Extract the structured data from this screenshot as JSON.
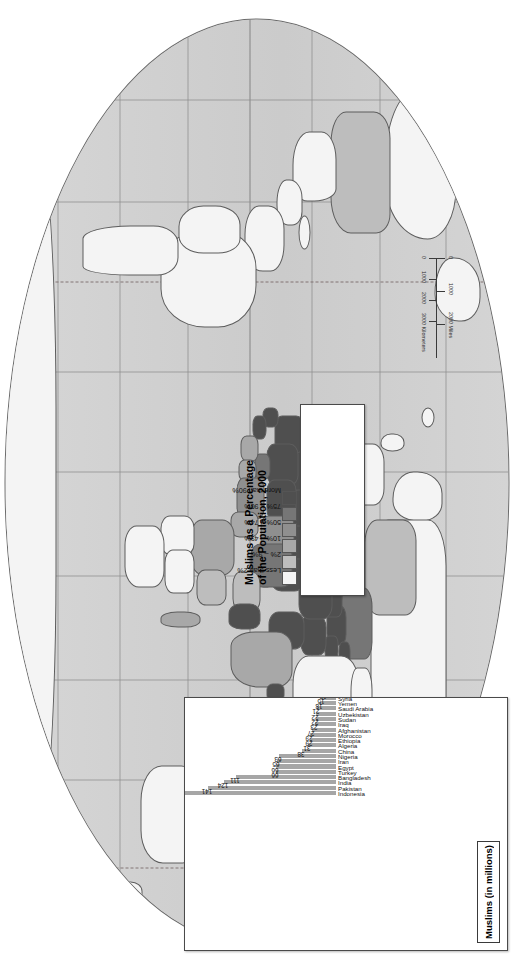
{
  "map": {
    "projection_label": "world-robinson",
    "background_color": "#ffffff",
    "ocean_color": "#cfcfcf",
    "graticule_color": "#8d8d8d",
    "border_color": "#5d5d5d"
  },
  "scalebar": {
    "miles_ticks": [
      "0",
      "1000",
      "2000"
    ],
    "miles_unit": "2000 Miles",
    "km_ticks": [
      "0",
      "1000",
      "2000",
      "3000"
    ],
    "km_unit": "3000 Kilometers"
  },
  "legend": {
    "title_line1": "Muslims as a Percentage",
    "title_line2": "of the Population, 2000",
    "classes": [
      {
        "label": "Less than 2%",
        "color": "#f4f4f4"
      },
      {
        "label": "2% – 9%",
        "color": "#bdbdbd"
      },
      {
        "label": "10% – 49%",
        "color": "#a8a8a8"
      },
      {
        "label": "50% – 74%",
        "color": "#8f8f8f"
      },
      {
        "label": "75% – 90%",
        "color": "#767676"
      },
      {
        "label": "More than 90%",
        "color": "#4f4f4f"
      }
    ]
  },
  "chart_data": {
    "type": "bar",
    "title": "Muslims (in millions)",
    "xlabel": "",
    "ylabel": "",
    "ylim": [
      0,
      190
    ],
    "grid": false,
    "legend_position": "none",
    "bar_color": "#a6a6a6",
    "categories": [
      "Indonesia",
      "Pakistan",
      "India",
      "Bangladesh",
      "Turkey",
      "Egypt",
      "Iran",
      "Nigeria",
      "China",
      "Algeria",
      "Ethiopia",
      "Morocco",
      "Afghanistan",
      "Iraq",
      "Sudan",
      "Uzbekistan",
      "Saudi Arabia",
      "Yemen",
      "Syria",
      "Tanzania",
      "Russia",
      "Malaysia",
      "Mali",
      "Tunisia",
      "Senegal",
      "Niger",
      "Azerbaijan",
      "Somalia",
      "Kazakhstan",
      "Guinea",
      "Burkino Faso",
      "United States",
      "Tajikistan",
      "Dem. Rep. of Congo",
      "Libya",
      "Turkmenistan",
      "Jordan",
      "Cote d'Ivoire",
      "Chad",
      "Cameroon"
    ],
    "values": [
      181,
      141,
      124,
      111,
      66,
      66,
      65,
      63,
      38,
      31,
      29,
      29,
      27,
      23,
      22,
      22,
      21,
      18,
      15,
      13,
      12,
      12,
      10,
      10,
      9,
      8,
      8,
      7,
      7,
      6,
      6,
      6,
      5,
      5,
      5,
      5,
      5,
      4,
      4,
      4
    ]
  }
}
